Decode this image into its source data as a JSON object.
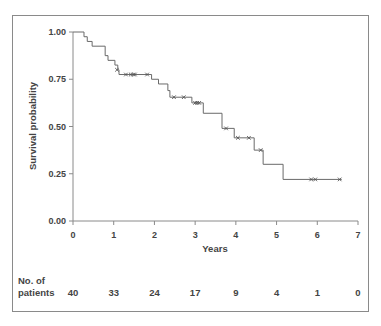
{
  "chart_data": {
    "type": "line",
    "subtype": "kaplan-meier",
    "title": "",
    "xlabel": "Years",
    "ylabel": "Survival probability",
    "xlim": [
      0,
      7
    ],
    "ylim": [
      0,
      1
    ],
    "x_ticks": [
      "0",
      "1",
      "2",
      "3",
      "4",
      "5",
      "6",
      "7"
    ],
    "x_tick_values": [
      0,
      1,
      2,
      3,
      4,
      5,
      6,
      7
    ],
    "y_ticks": [
      "0.00",
      "0.25",
      "0.50",
      "0.75",
      "1.00"
    ],
    "y_tick_values": [
      0,
      0.25,
      0.5,
      0.75,
      1.0
    ],
    "grid": false,
    "series": [
      {
        "name": "Survival",
        "steps": [
          [
            0,
            1.0
          ],
          [
            0.27,
            0.975
          ],
          [
            0.35,
            0.95
          ],
          [
            0.47,
            0.925
          ],
          [
            0.79,
            0.875
          ],
          [
            0.86,
            0.85
          ],
          [
            1.03,
            0.825
          ],
          [
            1.1,
            0.8
          ],
          [
            1.13,
            0.775
          ],
          [
            1.93,
            0.75
          ],
          [
            2.1,
            0.725
          ],
          [
            2.33,
            0.69
          ],
          [
            2.38,
            0.655
          ],
          [
            2.92,
            0.625
          ],
          [
            3.2,
            0.57
          ],
          [
            3.66,
            0.49
          ],
          [
            3.96,
            0.44
          ],
          [
            4.45,
            0.375
          ],
          [
            4.67,
            0.3
          ],
          [
            5.16,
            0.22
          ],
          [
            6.6,
            0.22
          ]
        ],
        "censored": [
          [
            1.08,
            0.8
          ],
          [
            1.3,
            0.775
          ],
          [
            1.42,
            0.775
          ],
          [
            1.48,
            0.775
          ],
          [
            1.52,
            0.775
          ],
          [
            1.82,
            0.775
          ],
          [
            2.48,
            0.655
          ],
          [
            2.72,
            0.655
          ],
          [
            3.0,
            0.625
          ],
          [
            3.05,
            0.625
          ],
          [
            3.1,
            0.625
          ],
          [
            3.76,
            0.49
          ],
          [
            4.05,
            0.44
          ],
          [
            4.32,
            0.44
          ],
          [
            4.61,
            0.375
          ],
          [
            5.85,
            0.22
          ],
          [
            5.95,
            0.22
          ],
          [
            6.55,
            0.22
          ]
        ]
      }
    ],
    "risk_table": {
      "label_line1": "No. of",
      "label_line2": "patients",
      "counts": [
        "40",
        "33",
        "24",
        "17",
        "9",
        "4",
        "1",
        "0"
      ]
    }
  }
}
